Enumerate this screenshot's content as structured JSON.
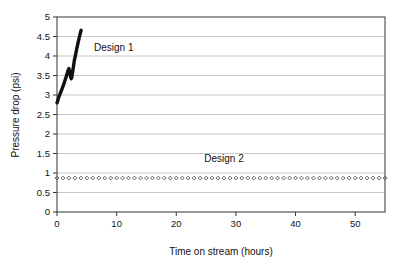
{
  "chart_data": {
    "type": "line",
    "title": "",
    "xlabel": "Time on stream (hours)",
    "ylabel": "Pressure drop (psi)",
    "xlim": [
      0,
      55
    ],
    "ylim": [
      0,
      5
    ],
    "xticks": [
      0,
      10,
      20,
      30,
      40,
      50
    ],
    "xtick_labels": [
      "0",
      "10",
      "20",
      "30",
      "40",
      "50"
    ],
    "yticks": [
      0,
      0.5,
      1,
      1.5,
      2,
      2.5,
      3,
      3.5,
      4,
      4.5,
      5
    ],
    "ytick_labels": [
      "0",
      "0.5",
      "1",
      "1.5",
      "2",
      "2.5",
      "3",
      "3.5",
      "4",
      "4.5",
      "5"
    ],
    "grid": "horizontal",
    "legend_position": "inline-annotation",
    "series": [
      {
        "name": "Design 1",
        "style": "thick-solid-line",
        "color": "#111111",
        "annotation": "Design 1",
        "annotation_x": 6.2,
        "annotation_y": 4.12,
        "x": [
          0.0,
          0.15,
          0.3,
          0.5,
          0.75,
          1.0,
          1.25,
          1.5,
          1.7,
          1.85,
          2.0,
          2.1,
          2.2,
          2.3,
          2.4,
          2.5,
          2.6,
          2.75,
          2.9,
          3.1,
          3.3,
          3.5,
          3.7,
          3.9,
          4.05
        ],
        "y": [
          2.8,
          2.86,
          2.95,
          3.02,
          3.12,
          3.22,
          3.33,
          3.45,
          3.55,
          3.63,
          3.68,
          3.62,
          3.52,
          3.45,
          3.42,
          3.47,
          3.58,
          3.72,
          3.88,
          4.02,
          4.18,
          4.32,
          4.45,
          4.58,
          4.66
        ]
      },
      {
        "name": "Design 2",
        "style": "open-diamond-markers",
        "color": "#555555",
        "annotation": "Design 2",
        "annotation_x": 28.0,
        "annotation_y": 1.27,
        "marker_count": 56,
        "x_start": 0.0,
        "x_end": 55.0,
        "y_constant": 0.87
      }
    ]
  },
  "axes": {
    "frame_color": "#333333",
    "gridline_color": "#c8c8c8"
  }
}
